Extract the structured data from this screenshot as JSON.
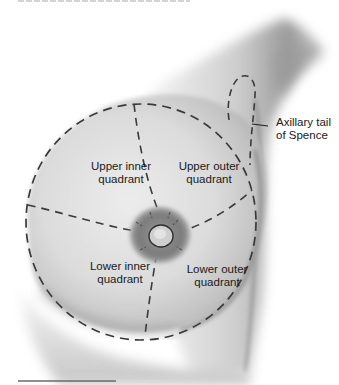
{
  "figure": {
    "type": "anatomical-diagram",
    "labels": {
      "upper_inner": [
        "Upper inner",
        "quadrant"
      ],
      "upper_outer": [
        "Upper outer",
        "quadrant"
      ],
      "lower_inner": [
        "Lower inner",
        "quadrant"
      ],
      "lower_outer": [
        "Lower outer",
        "quadrant"
      ],
      "axillary_tail": [
        "Axillary tail",
        "of Spence"
      ]
    },
    "colors": {
      "background": "#ffffff",
      "skin_light": "#e4e4e4",
      "skin_mid": "#bdbdbd",
      "skin_dark": "#7a7a7a",
      "areola": "#8c8c8c",
      "dashed_line": "#3a3a3a",
      "text": "#1a1a1a"
    }
  }
}
